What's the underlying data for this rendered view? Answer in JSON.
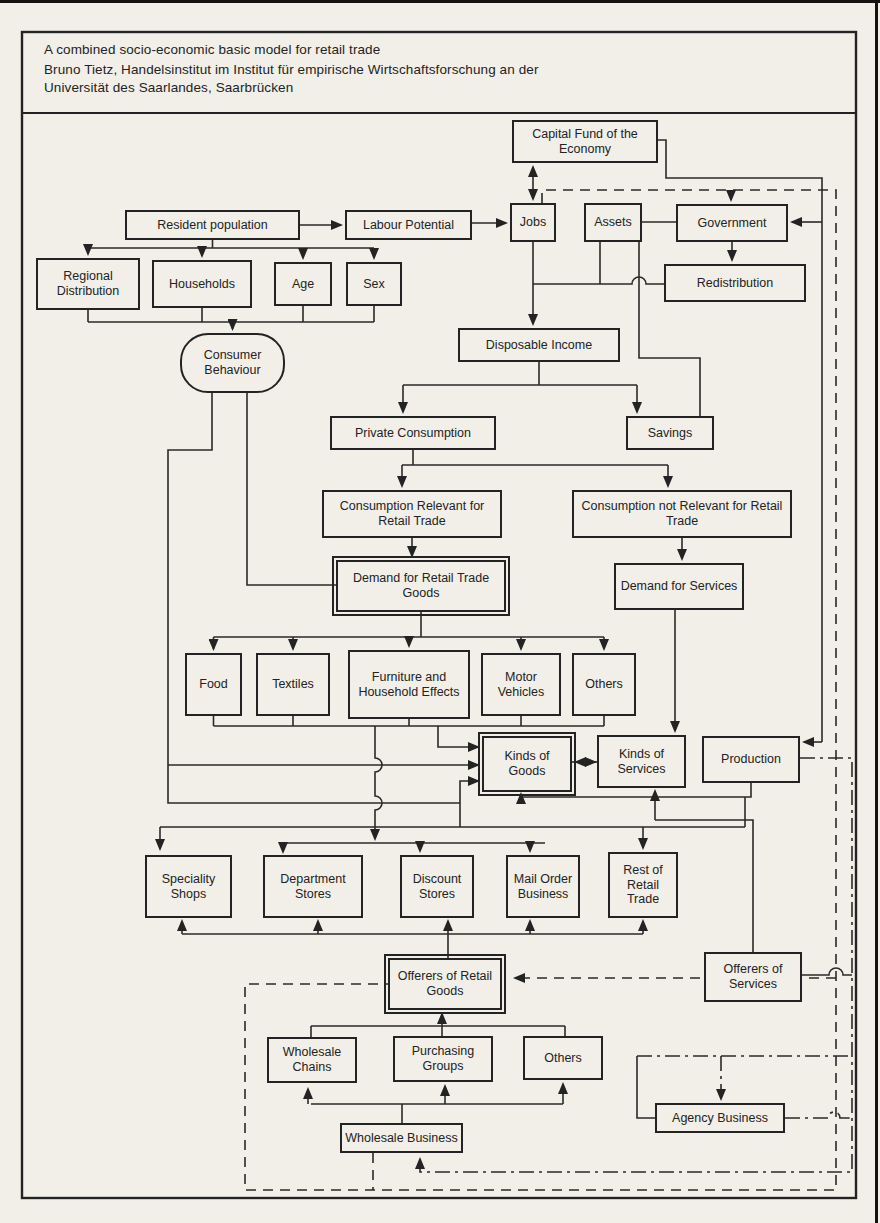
{
  "header": {
    "title": "A combined socio-economic basic model for retail trade",
    "author_line1": "Bruno Tietz, Handelsinstitut im Institut für empirische Wirtschaftsforschung an der",
    "author_line2": "Universität des Saarlandes, Saarbrücken"
  },
  "colors": {
    "ink": "#232323",
    "paper": "#f1efe8"
  },
  "nodes": {
    "capital_fund": {
      "label": "Capital Fund of the Economy"
    },
    "resident_population": {
      "label": "Resident population"
    },
    "labour_potential": {
      "label": "Labour Potential"
    },
    "jobs": {
      "label": "Jobs"
    },
    "assets": {
      "label": "Assets"
    },
    "government": {
      "label": "Government"
    },
    "redistribution": {
      "label": "Redistribution"
    },
    "regional_distribution": {
      "label": "Regional Distribution"
    },
    "households": {
      "label": "Households"
    },
    "age": {
      "label": "Age"
    },
    "sex": {
      "label": "Sex"
    },
    "consumer_behaviour": {
      "label": "Consumer Behaviour"
    },
    "disposable_income": {
      "label": "Disposable Income"
    },
    "private_consumption": {
      "label": "Private Consumption"
    },
    "savings": {
      "label": "Savings"
    },
    "consumption_relevant": {
      "label": "Consumption Relevant for Retail Trade"
    },
    "consumption_not_relevant": {
      "label": "Consumption not Relevant for Retail Trade"
    },
    "demand_retail_goods": {
      "label": "Demand for Retail Trade Goods"
    },
    "demand_services": {
      "label": "Demand for Services"
    },
    "food": {
      "label": "Food"
    },
    "textiles": {
      "label": "Textiles"
    },
    "furniture": {
      "label": "Furniture and Household Effects"
    },
    "motor_vehicles": {
      "label": "Motor Vehicles"
    },
    "others_goods": {
      "label": "Others"
    },
    "kinds_of_goods": {
      "label": "Kinds of Goods"
    },
    "kinds_of_services": {
      "label": "Kinds of Services"
    },
    "production": {
      "label": "Production"
    },
    "speciality_shops": {
      "label": "Speciality Shops"
    },
    "department_stores": {
      "label": "Department Stores"
    },
    "discount_stores": {
      "label": "Discount Stores"
    },
    "mail_order": {
      "label": "Mail Order Business"
    },
    "rest_retail": {
      "label": "Rest of Retail Trade"
    },
    "offerers_retail_goods": {
      "label": "Offerers of Retail Goods"
    },
    "offerers_services": {
      "label": "Offerers of Services"
    },
    "wholesale_chains": {
      "label": "Wholesale Chains"
    },
    "purchasing_groups": {
      "label": "Purchasing Groups"
    },
    "others_wholesale": {
      "label": "Others"
    },
    "wholesale_business": {
      "label": "Wholesale Business"
    },
    "agency_business": {
      "label": "Agency Business"
    }
  }
}
